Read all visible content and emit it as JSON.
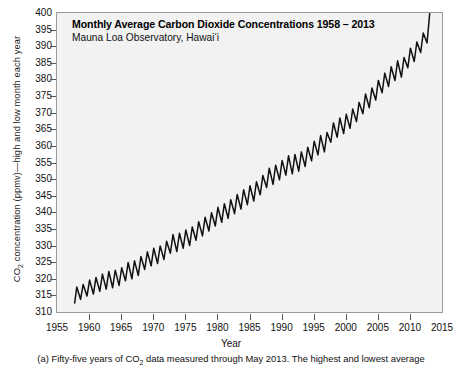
{
  "chart_data": {
    "type": "line",
    "title": "Monthly Average Carbon Dioxide Concentrations 1958 – 2013",
    "subtitle": "Mauna Loa Observatory, Hawai‘i",
    "xlabel": "Year",
    "ylabel_prefix": "CO",
    "ylabel_sub": "2",
    "ylabel_suffix": " concentration (ppmv)—high and low month each year",
    "ylabel_full": "CO2 concentration (ppmv)—high and low month each year",
    "xlim": [
      1955,
      2015
    ],
    "ylim": [
      310,
      400
    ],
    "xticks": [
      1955,
      1960,
      1965,
      1970,
      1975,
      1980,
      1985,
      1990,
      1995,
      2000,
      2005,
      2010,
      2015
    ],
    "yticks": [
      310,
      315,
      320,
      325,
      330,
      335,
      340,
      345,
      350,
      355,
      360,
      365,
      370,
      375,
      380,
      385,
      390,
      395,
      400
    ],
    "grid": false,
    "legend": "none",
    "line_color": "#111111",
    "plot_background": "#f2f2f2",
    "frame_color": "#9a9a9a",
    "series": [
      {
        "name": "Annual high (May) CO2",
        "x": [
          1958,
          1959,
          1960,
          1961,
          1962,
          1963,
          1964,
          1965,
          1966,
          1967,
          1968,
          1969,
          1970,
          1971,
          1972,
          1973,
          1974,
          1975,
          1976,
          1977,
          1978,
          1979,
          1980,
          1981,
          1982,
          1983,
          1984,
          1985,
          1986,
          1987,
          1988,
          1989,
          1990,
          1991,
          1992,
          1993,
          1994,
          1995,
          1996,
          1997,
          1998,
          1999,
          2000,
          2001,
          2002,
          2003,
          2004,
          2005,
          2006,
          2007,
          2008,
          2009,
          2010,
          2011,
          2012,
          2013
        ],
        "values": [
          317.5,
          318.3,
          319.6,
          320.4,
          321.4,
          322.2,
          322.6,
          323.3,
          324.9,
          325.4,
          326.7,
          328.1,
          329.2,
          329.9,
          331.3,
          333.3,
          333.7,
          334.7,
          335.6,
          337.2,
          338.5,
          339.9,
          341.5,
          342.6,
          343.8,
          345.4,
          346.8,
          348.0,
          349.2,
          351.1,
          353.3,
          354.2,
          355.6,
          357.0,
          357.4,
          358.2,
          359.6,
          361.4,
          363.1,
          364.0,
          366.9,
          368.4,
          369.5,
          371.1,
          373.1,
          375.6,
          377.4,
          379.7,
          381.9,
          383.8,
          385.6,
          386.6,
          389.4,
          391.3,
          394.0,
          399.8
        ]
      },
      {
        "name": "Annual low (September/October) CO2",
        "x": [
          1958,
          1959,
          1960,
          1961,
          1962,
          1963,
          1964,
          1965,
          1966,
          1967,
          1968,
          1969,
          1970,
          1971,
          1972,
          1973,
          1974,
          1975,
          1976,
          1977,
          1978,
          1979,
          1980,
          1981,
          1982,
          1983,
          1984,
          1985,
          1986,
          1987,
          1988,
          1989,
          1990,
          1991,
          1992,
          1993,
          1994,
          1995,
          1996,
          1997,
          1998,
          1999,
          2000,
          2001,
          2002,
          2003,
          2004,
          2005,
          2006,
          2007,
          2008,
          2009,
          2010,
          2011,
          2012,
          2013
        ],
        "values": [
          312.7,
          313.8,
          314.8,
          315.4,
          316.2,
          316.9,
          317.3,
          318.0,
          319.4,
          320.0,
          321.0,
          322.8,
          323.9,
          324.6,
          325.8,
          327.7,
          328.2,
          329.2,
          330.0,
          331.6,
          332.9,
          334.4,
          335.9,
          337.0,
          338.2,
          339.6,
          341.0,
          342.3,
          343.4,
          345.3,
          347.5,
          348.4,
          349.8,
          351.2,
          351.6,
          352.4,
          353.8,
          355.5,
          357.3,
          358.2,
          361.1,
          362.6,
          363.7,
          365.3,
          367.3,
          369.7,
          371.5,
          373.8,
          376.0,
          377.9,
          379.7,
          380.7,
          383.5,
          385.4,
          388.1,
          391.0
        ]
      }
    ]
  },
  "caption": {
    "prefix": "(a) Fifty-five years of CO",
    "sub": "2",
    "suffix": " data measured through May 2013. The highest and lowest average"
  }
}
